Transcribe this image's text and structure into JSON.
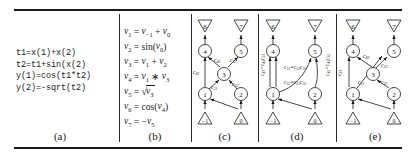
{
  "figure": {
    "panels": [
      {
        "id": "a",
        "caption": "(a)"
      },
      {
        "id": "b",
        "caption": "(b)"
      },
      {
        "id": "c",
        "caption": "(c)"
      },
      {
        "id": "d",
        "caption": "(d)"
      },
      {
        "id": "e",
        "caption": "(e)"
      }
    ]
  },
  "code": {
    "lines": [
      "t1=x(1)+x(2)",
      "t2=t1+sin(x(2)",
      "y(1)=cos(t1*t2)",
      "y(2)=-sqrt(t2)"
    ],
    "text": "t1=x(1)+x(2)\nt2=t1+sin(x(2)\ny(1)=cos(t1*t2)\ny(2)=-sqrt(t2)"
  },
  "equations": [
    {
      "lhs": "v",
      "lhs_sub": "1",
      "rhs": "v_{-1} + v_0"
    },
    {
      "lhs": "v",
      "lhs_sub": "2",
      "rhs": "sin(v_0)"
    },
    {
      "lhs": "v",
      "lhs_sub": "3",
      "rhs": "v_1 + v_2"
    },
    {
      "lhs": "v",
      "lhs_sub": "4",
      "rhs": "v_1 * v_3"
    },
    {
      "lhs": "v",
      "lhs_sub": "5",
      "rhs": "sqrt(v_3)"
    },
    {
      "lhs": "v",
      "lhs_sub": "6",
      "rhs": "cos(v_4)"
    },
    {
      "lhs": "v",
      "lhs_sub": "7",
      "rhs": "-v_5"
    }
  ],
  "graph": {
    "independent_nodes": [
      "-1",
      "0"
    ],
    "intermediate_nodes": [
      "1",
      "2",
      "3",
      "4",
      "5"
    ],
    "output_nodes": [
      "6",
      "7"
    ],
    "panel_c": {
      "edge_labels": [
        "c43",
        "c53",
        "c41",
        "c31",
        "c32"
      ],
      "nodes_shown": [
        "-1",
        "0",
        "1",
        "2",
        "3",
        "4",
        "5",
        "6",
        "7"
      ]
    },
    "panel_d": {
      "edge_labels_top": [
        "c51",
        "=",
        "c53",
        "c31"
      ],
      "edge_labels_bottom": [
        "c52",
        "=",
        "c53",
        "c32"
      ],
      "edge_labels_left": [
        "c41",
        "=",
        "c43",
        "c31"
      ],
      "edge_labels_right": [
        "c42",
        "=",
        "c43",
        "c32"
      ],
      "nodes_shown": [
        "-1",
        "0",
        "1",
        "2",
        "4",
        "5",
        "6",
        "7"
      ]
    },
    "panel_e": {
      "edge_labels": [
        "c43",
        "c53",
        "c41",
        "c51",
        "c32"
      ],
      "nodes_shown": [
        "-1",
        "0",
        "1",
        "2",
        "3",
        "4",
        "5",
        "6",
        "7"
      ]
    }
  },
  "colors": {
    "ink": "#1a1a1a",
    "line": "#2a2a2a",
    "paper": "#ffffff"
  }
}
